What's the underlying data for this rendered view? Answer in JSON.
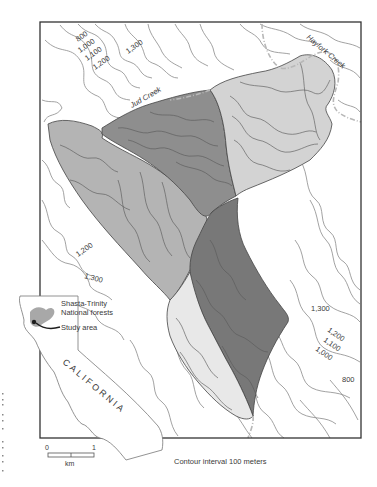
{
  "map": {
    "title": "Study area watersheds near Shasta-Trinity National forests",
    "contour_interval_note": "Contour interval 100 meters",
    "creek_labels": [
      {
        "id": "jud-creek",
        "text": "Jud Creek"
      },
      {
        "id": "hayfork-creek",
        "text": "Hayfork Creek"
      }
    ],
    "contour_labels": {
      "top_left": [
        "800",
        "1,000",
        "1,100",
        "1,200"
      ],
      "top_center": "1,300",
      "left_mid_1": "1,200",
      "left_mid_2": "1,300",
      "right_1": "1,300",
      "right_2": "1,200",
      "right_3": "1,100",
      "right_4": "1,000",
      "right_5": "800"
    },
    "colors": {
      "background": "#ffffff",
      "frame": "#333333",
      "contour": "#8a8a8a",
      "watershed_west": "#b4b4b4",
      "watershed_north": "#8e8e8e",
      "watershed_northeast": "#d3d3d3",
      "watershed_center": "#787878",
      "watershed_southeast": "#e8e8e8",
      "legend_forest": "#a8a8a8",
      "legend_study": "#1e1e1e"
    }
  },
  "inset": {
    "state_label": "CALIFORNIA",
    "legend": [
      {
        "id": "forests",
        "text_line1": "Shasta-Trinity",
        "text_line2": "National forests"
      },
      {
        "id": "study",
        "text": "Study area"
      }
    ]
  },
  "scale_bar": {
    "min_label": "0",
    "max_label": "1",
    "unit": "km"
  }
}
